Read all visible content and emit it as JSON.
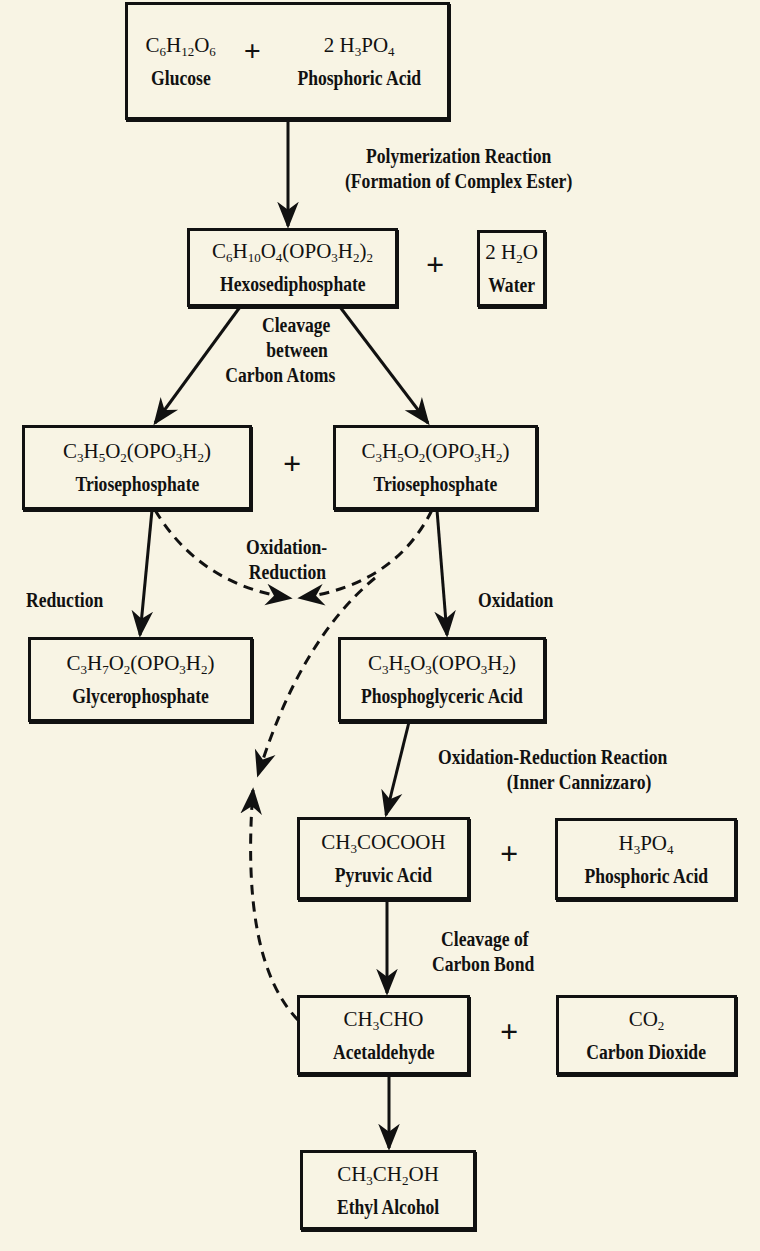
{
  "diagram": {
    "nodes": {
      "glucose": {
        "formula_html": "C<sub>6</sub>H<sub>12</sub>O<sub>6</sub>",
        "name": "Glucose"
      },
      "phosphoric_acid_1": {
        "formula_html": "2 H<sub>3</sub>PO<sub>4</sub>",
        "name": "Phosphoric Acid"
      },
      "hexosediphosphate": {
        "formula_html": "C<sub>6</sub>H<sub>10</sub>O<sub>4</sub>(OPO<sub>3</sub>H<sub>2</sub>)<sub>2</sub>",
        "name": "Hexosediphosphate"
      },
      "water": {
        "formula_html": "2 H<sub>2</sub>O",
        "name": "Water"
      },
      "triosephosphate_left": {
        "formula_html": "C<sub>3</sub>H<sub>5</sub>O<sub>2</sub>(OPO<sub>3</sub>H<sub>2</sub>)",
        "name": "Triosephosphate"
      },
      "triosephosphate_right": {
        "formula_html": "C<sub>3</sub>H<sub>5</sub>O<sub>2</sub>(OPO<sub>3</sub>H<sub>2</sub>)",
        "name": "Triosephosphate"
      },
      "glycerophosphate": {
        "formula_html": "C<sub>3</sub>H<sub>7</sub>O<sub>2</sub>(OPO<sub>3</sub>H<sub>2</sub>)",
        "name": "Glycerophosphate"
      },
      "phosphoglyceric_acid": {
        "formula_html": "C<sub>3</sub>H<sub>5</sub>O<sub>3</sub>(OPO<sub>3</sub>H<sub>2</sub>)",
        "name": "Phosphoglyceric Acid"
      },
      "pyruvic_acid": {
        "formula_html": "CH<sub>3</sub>COCOOH",
        "name": "Pyruvic Acid"
      },
      "phosphoric_acid_2": {
        "formula_html": "H<sub>3</sub>PO<sub>4</sub>",
        "name": "Phosphoric Acid"
      },
      "acetaldehyde": {
        "formula_html": "CH<sub>3</sub>CHO",
        "name": "Acetaldehyde"
      },
      "carbon_dioxide": {
        "formula_html": "CO<sub>2</sub>",
        "name": "Carbon Dioxide"
      },
      "ethyl_alcohol": {
        "formula_html": "CH<sub>3</sub>CH<sub>2</sub>OH",
        "name": "Ethyl Alcohol"
      }
    },
    "plus_sign": "+",
    "edge_labels": {
      "polymerization_1": "Polymerization Reaction",
      "polymerization_2": "(Formation of Complex Ester)",
      "cleavage_atoms_1": "Cleavage",
      "cleavage_atoms_2": "between",
      "cleavage_atoms_3": "Carbon Atoms",
      "oxred_1": "Oxidation-",
      "oxred_2": "Reduction",
      "reduction": "Reduction",
      "oxidation": "Oxidation",
      "cannizzaro_1": "Oxidation-Reduction Reaction",
      "cannizzaro_2": "(Inner Cannizzaro)",
      "cleavage_bond_1": "Cleavage of",
      "cleavage_bond_2": "Carbon Bond"
    },
    "edges": [
      {
        "from": "glucose+phosphoric_acid_1",
        "to": "hexosediphosphate",
        "style": "solid",
        "label": "polymerization"
      },
      {
        "from": "hexosediphosphate",
        "to": "triosephosphate_left",
        "style": "solid",
        "label": "cleavage_atoms"
      },
      {
        "from": "hexosediphosphate",
        "to": "triosephosphate_right",
        "style": "solid"
      },
      {
        "from": "triosephosphate_left",
        "to": "glycerophosphate",
        "style": "solid",
        "label": "reduction"
      },
      {
        "from": "triosephosphate_right",
        "to": "phosphoglyceric_acid",
        "style": "solid",
        "label": "oxidation"
      },
      {
        "from": "triosephosphate_left",
        "to": "triosephosphate_right",
        "style": "dashed",
        "label": "oxred"
      },
      {
        "from": "triosephosphate_right",
        "to": "acetaldehyde",
        "style": "dashed"
      },
      {
        "from": "phosphoglyceric_acid",
        "to": "pyruvic_acid",
        "style": "solid",
        "label": "cannizzaro"
      },
      {
        "from": "pyruvic_acid",
        "to": "acetaldehyde",
        "style": "solid",
        "label": "cleavage_bond"
      },
      {
        "from": "acetaldehyde",
        "to": "ethyl_alcohol",
        "style": "solid"
      }
    ]
  }
}
